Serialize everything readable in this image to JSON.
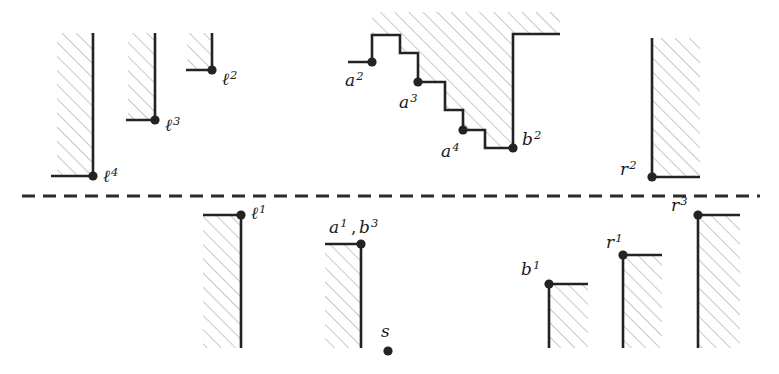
{
  "figure": {
    "width": 779,
    "height": 374,
    "background_color": "#ffffff",
    "stroke_color": "#232323",
    "hatch_color": "#b9b9b9",
    "divider_color": "#2b2b2b"
  },
  "divider": {
    "name": "horizontal-dashed-separator",
    "y": 196,
    "x_start": 22,
    "x_end": 760,
    "dash": "13 8"
  },
  "labels": {
    "l4": {
      "base": "ℓ",
      "sup": "4",
      "x": 103,
      "y": 182
    },
    "l3": {
      "base": "ℓ",
      "sup": "3",
      "x": 165,
      "y": 131
    },
    "l2": {
      "base": "ℓ",
      "sup": "2",
      "x": 222,
      "y": 85
    },
    "a2": {
      "base": "a",
      "sup": "2",
      "x": 345,
      "y": 86
    },
    "a3": {
      "base": "a",
      "sup": "3",
      "x": 399,
      "y": 108
    },
    "a4": {
      "base": "a",
      "sup": "4",
      "x": 441,
      "y": 157
    },
    "b2": {
      "base": "b",
      "sup": "2",
      "x": 522,
      "y": 145
    },
    "r2": {
      "base": "r",
      "sup": "2",
      "x": 620,
      "y": 175
    },
    "l1": {
      "base": "ℓ",
      "sup": "1",
      "x": 251,
      "y": 219
    },
    "a1b3_first": {
      "base": "a",
      "sup": "1",
      "x": 329,
      "y": 233
    },
    "a1b3_comma": {
      "text": ",",
      "x": 351,
      "y": 233
    },
    "a1b3_second": {
      "base": "b",
      "sup": "3",
      "x": 359,
      "y": 233
    },
    "s": {
      "base": "s",
      "sup": "",
      "x": 381,
      "y": 337
    },
    "b1": {
      "base": "b",
      "sup": "1",
      "x": 521,
      "y": 275
    },
    "r1": {
      "base": "r",
      "sup": "1",
      "x": 606,
      "y": 248
    },
    "r3": {
      "base": "r",
      "sup": "3",
      "x": 671,
      "y": 211
    }
  },
  "vertices": [
    {
      "name": "vertex-l4",
      "x": 93,
      "y": 176,
      "r": 4.6
    },
    {
      "name": "vertex-l3",
      "x": 155,
      "y": 120,
      "r": 4.6
    },
    {
      "name": "vertex-l2",
      "x": 212,
      "y": 70,
      "r": 4.6
    },
    {
      "name": "vertex-a2",
      "x": 372,
      "y": 62,
      "r": 4.6
    },
    {
      "name": "vertex-a3",
      "x": 418,
      "y": 82,
      "r": 4.6
    },
    {
      "name": "vertex-a4",
      "x": 463,
      "y": 130,
      "r": 4.6
    },
    {
      "name": "vertex-b2",
      "x": 513,
      "y": 148,
      "r": 4.6
    },
    {
      "name": "vertex-r2",
      "x": 652,
      "y": 177,
      "r": 4.6
    },
    {
      "name": "vertex-l1",
      "x": 241,
      "y": 215,
      "r": 4.6
    },
    {
      "name": "vertex-a1-b3",
      "x": 361,
      "y": 244,
      "r": 4.6
    },
    {
      "name": "vertex-s",
      "x": 388,
      "y": 351,
      "r": 4.6
    },
    {
      "name": "vertex-b1",
      "x": 549,
      "y": 284,
      "r": 4.6
    },
    {
      "name": "vertex-r1",
      "x": 623,
      "y": 255,
      "r": 4.6
    },
    {
      "name": "vertex-r3",
      "x": 698,
      "y": 215,
      "r": 4.6
    }
  ],
  "obstacles": [
    {
      "name": "obstacle-l4",
      "path": "M 51 176 L 93 176 L 93 33",
      "hatch_region": "M 57 33 L 93 33 L 93 176 L 57 176 Z"
    },
    {
      "name": "obstacle-l3",
      "path": "M 126 120 L 155 120 L 155 33",
      "hatch_region": "M 128 33 L 155 33 L 155 120 L 128 120 Z"
    },
    {
      "name": "obstacle-l2",
      "path": "M 186 70 L 212 70 L 212 33",
      "hatch_region": "M 187 33 L 212 33 L 212 70 L 187 70 Z"
    },
    {
      "name": "obstacle-staircase-a2-b2",
      "path": "M 348 62 L 372 62 L 372 35 L 400 35 L 400 53 L 418 53 L 418 82 L 445 82 L 445 110 L 463 110 L 463 130 L 485 130 L 485 148 L 513 148 L 513 34 L 560 34",
      "hatch_region": "M 372 35 L 400 35 L 400 53 L 418 53 L 418 82 L 445 82 L 445 110 L 463 110 L 463 130 L 485 130 L 485 148 L 513 148 L 513 34 L 560 34 L 560 12 L 372 12 Z"
    },
    {
      "name": "obstacle-r2",
      "path": "M 652 38 L 652 177 L 700 177",
      "hatch_region": "M 652 38 L 700 38 L 700 177 L 652 177 Z"
    },
    {
      "name": "obstacle-l1",
      "path": "M 203 215 L 241 215 L 241 348",
      "hatch_region": "M 203 215 L 241 215 L 241 348 L 203 348 Z"
    },
    {
      "name": "obstacle-a1-b3",
      "path": "M 325 244 L 361 244 L 361 348",
      "hatch_region": "M 325 244 L 361 244 L 361 348 L 325 348 Z"
    },
    {
      "name": "obstacle-b1",
      "path": "M 588 284 L 549 284 L 549 348",
      "hatch_region": "M 549 284 L 588 284 L 588 348 L 549 348 Z"
    },
    {
      "name": "obstacle-r1",
      "path": "M 662 255 L 623 255 L 623 348",
      "hatch_region": "M 623 255 L 662 255 L 662 348 L 623 348 Z"
    },
    {
      "name": "obstacle-r3",
      "path": "M 740 215 L 698 215 L 698 348",
      "hatch_region": "M 698 215 L 740 215 L 740 348 L 698 348 Z"
    }
  ]
}
